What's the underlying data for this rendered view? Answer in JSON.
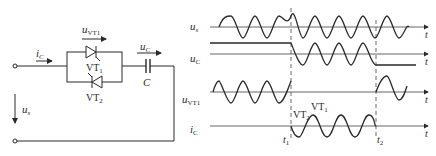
{
  "circuit": {
    "current_label": "i",
    "current_sub": "C",
    "source_label": "u",
    "source_sub": "s",
    "thyristor_voltage_label": "u",
    "thyristor_voltage_sub": "VT1",
    "capacitor_voltage_label": "u",
    "capacitor_voltage_sub": "C",
    "thyristor1_label": "VT",
    "thyristor1_sub": "1",
    "thyristor2_label": "VT",
    "thyristor2_sub": "2",
    "capacitor_label": "C"
  },
  "waveforms": {
    "rows": [
      {
        "name": "u",
        "sub": "s",
        "axis_label": "t"
      },
      {
        "name": "u",
        "sub": "C",
        "axis_label": "t"
      },
      {
        "name": "u",
        "sub": "VT1",
        "axis_label": "t"
      },
      {
        "name": "i",
        "sub": "C",
        "axis_label": "t"
      }
    ],
    "markers": {
      "t1": "t",
      "t1_sub": "1",
      "t2": "t",
      "t2_sub": "2"
    },
    "annotations": {
      "vt2": "VT",
      "vt2_sub": "2",
      "vt1": "VT",
      "vt1_sub": "1"
    }
  },
  "colors": {
    "line": "#2a2a2a",
    "axis": "#555555"
  }
}
